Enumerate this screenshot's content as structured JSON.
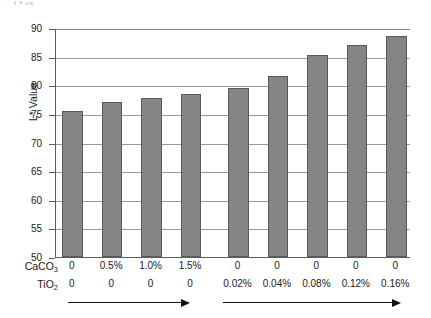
{
  "figure": {
    "cropped_title_fragment": "L* vs",
    "yaxis_title": "L* Value"
  },
  "chart_data": {
    "type": "bar",
    "title": "",
    "xlabel": "",
    "ylabel": "L* Value",
    "ylim": [
      50,
      90
    ],
    "yticks": [
      50,
      55,
      60,
      65,
      70,
      75,
      80,
      85,
      90
    ],
    "ytick_labels": [
      "50",
      "55",
      "60",
      "65",
      "70",
      "75",
      "80",
      "85",
      "90"
    ],
    "grid": true,
    "legend": "none",
    "bar_color": "#858585",
    "bar_edge_color": "#5a5a5a",
    "categories": [
      "CaCO3 0 / TiO2 0",
      "CaCO3 0.5% / TiO2 0",
      "CaCO3 1.0% / TiO2 0",
      "CaCO3 1.5% / TiO2 0",
      "CaCO3 0 / TiO2 0.02%",
      "CaCO3 0 / TiO2 0.04%",
      "CaCO3 0 / TiO2 0.08%",
      "CaCO3 0 / TiO2 0.12%",
      "CaCO3 0 / TiO2 0.16%"
    ],
    "values": [
      75.5,
      77.1,
      77.7,
      78.4,
      79.6,
      81.7,
      85.2,
      87.1,
      88.6
    ],
    "axis_rows": [
      {
        "name": "CaCO3",
        "label_html": "CaCO<sub>3</sub>",
        "values": [
          "0",
          "0.5%",
          "1.0%",
          "1.5%",
          "0",
          "0",
          "0",
          "0",
          "0"
        ]
      },
      {
        "name": "TiO2",
        "label_html": "TiO<sub>2</sub>",
        "values": [
          "0",
          "0",
          "0",
          "0",
          "0.02%",
          "0.04%",
          "0.08%",
          "0.12%",
          "0.16%"
        ]
      }
    ],
    "annotations": [
      {
        "type": "arrow",
        "direction": "right",
        "group": "CaCO3-series"
      },
      {
        "type": "arrow",
        "direction": "right",
        "group": "TiO2-series"
      }
    ]
  }
}
